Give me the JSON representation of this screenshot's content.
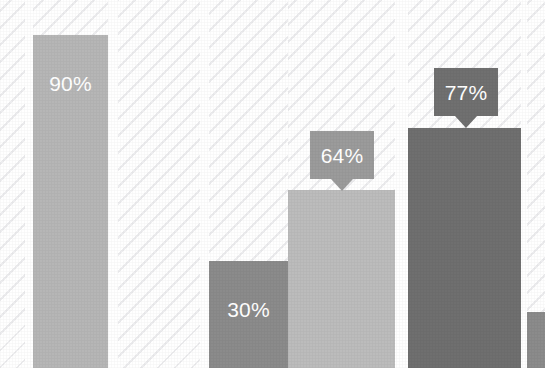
{
  "chart_data": {
    "type": "bar",
    "title": "",
    "subtitle": "",
    "xlabel": "",
    "ylabel": "",
    "ylim": [
      0,
      100
    ],
    "grid": false,
    "legend": null,
    "categories": [
      "",
      "",
      "",
      "",
      "",
      "",
      ""
    ],
    "values": [
      null,
      90,
      null,
      30,
      64,
      77,
      null
    ],
    "labels": [
      "",
      "90%",
      "",
      "30%",
      "64%",
      "77%",
      ""
    ],
    "series": [
      {
        "name": "Percent",
        "values": [
          null,
          90,
          null,
          30,
          64,
          77,
          null
        ]
      }
    ],
    "bars": [
      {
        "id": "bar-0",
        "label": "",
        "value": null,
        "label_style": "none",
        "color": "#ffffff",
        "x": 0,
        "width": 25,
        "height": 0,
        "visible": false
      },
      {
        "id": "bar-1",
        "label": "90%",
        "value": 90,
        "label_style": "inline",
        "color": "#b6b6b6",
        "x": 33,
        "width": 75,
        "height": 333,
        "visible": true
      },
      {
        "id": "bar-2",
        "label": "",
        "value": null,
        "label_style": "none",
        "color": "#ffffff",
        "x": 118,
        "width": 82,
        "height": 0,
        "visible": false
      },
      {
        "id": "bar-3",
        "label": "30%",
        "value": 30,
        "label_style": "inline",
        "color": "#8b8b8b",
        "x": 209,
        "width": 79,
        "height": 107,
        "visible": true
      },
      {
        "id": "bar-4",
        "label": "64%",
        "value": 64,
        "label_style": "callout",
        "color": "#bcbcbc",
        "x": 288,
        "width": 107,
        "height": 178,
        "visible": true
      },
      {
        "id": "bar-5",
        "label": "77%",
        "value": 77,
        "label_style": "callout",
        "color": "#6f6f6f",
        "x": 408,
        "width": 113,
        "height": 240,
        "visible": true
      },
      {
        "id": "bar-6",
        "label": "",
        "value": null,
        "label_style": "none",
        "color": "#8b8b8b",
        "x": 527,
        "width": 18,
        "height": 56,
        "visible": true
      }
    ],
    "tracks": [
      {
        "id": "track-0",
        "x": 0,
        "width": 25
      },
      {
        "id": "track-1",
        "x": 33,
        "width": 75
      },
      {
        "id": "track-2",
        "x": 118,
        "width": 82
      },
      {
        "id": "track-3",
        "x": 209,
        "width": 79
      },
      {
        "id": "track-4",
        "x": 288,
        "width": 107
      },
      {
        "id": "track-5",
        "x": 408,
        "width": 113
      },
      {
        "id": "track-6",
        "x": 527,
        "width": 18
      }
    ],
    "callouts": [
      {
        "id": "callout-64",
        "text": "64%",
        "color": "#9b9b9b",
        "x": 310,
        "y": 131,
        "width": 64,
        "height": 48
      },
      {
        "id": "callout-77",
        "text": "77%",
        "color": "#707070",
        "x": 434,
        "y": 68,
        "width": 64,
        "height": 48
      }
    ],
    "colors": {
      "background": "#ffffff",
      "hatch": "#ededef",
      "bar_light": "#bcbcbc",
      "bar_mid": "#b6b6b6",
      "bar_medium": "#8b8b8b",
      "bar_dark": "#6f6f6f",
      "callout_light": "#9b9b9b",
      "callout_dark": "#707070",
      "label_text": "#ffffff"
    }
  }
}
